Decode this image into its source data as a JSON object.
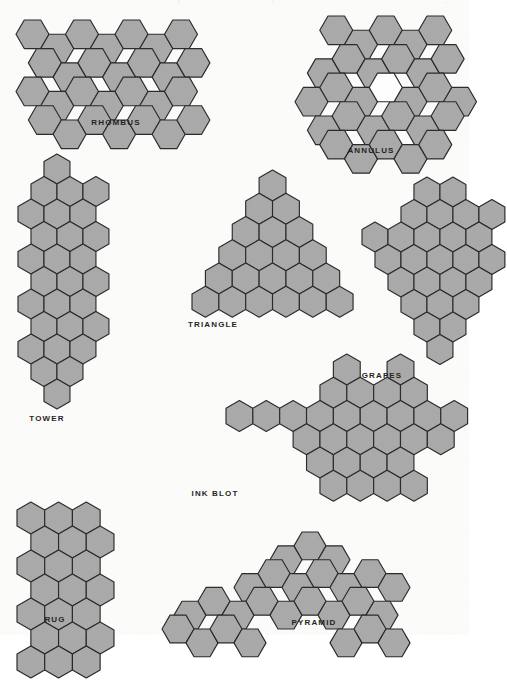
{
  "plate": {
    "width": 469,
    "height": 635,
    "background_color": "#fdfdfc",
    "hex_fill_color": "#a9a9a9",
    "hex_stroke_color": "#272727",
    "hole_fill_color": "#ffffff",
    "caption_color": "#1c1c1c",
    "header_fragment_left": "r",
    "header_fragment_mid": "f",
    "header_fragment_right": "..."
  },
  "shapes": [
    {
      "id": "rhombus",
      "label": "RHOMBUS",
      "orientation": "flat-top",
      "hex_count": 28,
      "description": "Four rows of seven flat-top hexagons, each row offset right to form a rhombus.",
      "size": 16.5,
      "origin_x": 14,
      "origin_y": 18,
      "caption_x": 116,
      "caption_y": 118,
      "cells": [
        [
          0,
          0
        ],
        [
          1,
          0
        ],
        [
          2,
          0
        ],
        [
          3,
          0
        ],
        [
          4,
          0
        ],
        [
          5,
          0
        ],
        [
          6,
          0
        ],
        [
          0,
          1
        ],
        [
          1,
          1
        ],
        [
          2,
          1
        ],
        [
          3,
          1
        ],
        [
          4,
          1
        ],
        [
          5,
          1
        ],
        [
          6,
          1
        ],
        [
          0,
          2
        ],
        [
          1,
          2
        ],
        [
          2,
          2
        ],
        [
          3,
          2
        ],
        [
          4,
          2
        ],
        [
          5,
          2
        ],
        [
          6,
          2
        ],
        [
          0,
          3
        ],
        [
          1,
          3
        ],
        [
          2,
          3
        ],
        [
          3,
          3
        ],
        [
          4,
          3
        ],
        [
          5,
          3
        ],
        [
          6,
          3
        ]
      ]
    },
    {
      "id": "annulus",
      "label": "ANNULUS",
      "orientation": "flat-top",
      "hex_count": 28,
      "description": "Hexagonal ring of radius two plus an outer band, with a single empty hexagon at the centre.",
      "size": 16.5,
      "origin_x": 293,
      "origin_y": 14,
      "caption_x": 371,
      "caption_y": 146,
      "cells": [
        [
          0,
          0
        ],
        [
          1,
          0
        ],
        [
          2,
          0
        ],
        [
          3,
          0
        ],
        [
          4,
          0
        ],
        [
          -1,
          1
        ],
        [
          0,
          1
        ],
        [
          1,
          1
        ],
        [
          2,
          1
        ],
        [
          3,
          1
        ],
        [
          4,
          1
        ],
        [
          -1,
          2
        ],
        [
          0,
          2
        ],
        [
          1,
          2
        ],
        [
          3,
          2
        ],
        [
          4,
          2
        ],
        [
          5,
          2
        ],
        [
          -1,
          3
        ],
        [
          0,
          3
        ],
        [
          1,
          3
        ],
        [
          2,
          3
        ],
        [
          3,
          3
        ],
        [
          4,
          3
        ],
        [
          0,
          4
        ],
        [
          1,
          4
        ],
        [
          2,
          4
        ],
        [
          3,
          4
        ],
        [
          4,
          4
        ]
      ],
      "holes": [
        [
          2,
          2
        ]
      ]
    },
    {
      "id": "tower",
      "label": "TOWER",
      "orientation": "pointy-top",
      "hex_count": 28,
      "description": "A tall narrow column of pointy-top hexagons, alternating rows of three and two.",
      "size": 15.0,
      "origin_x": 16,
      "origin_y": 152,
      "caption_x": 47,
      "caption_y": 414,
      "cells": [
        [
          1,
          0
        ],
        [
          0,
          1
        ],
        [
          1,
          1
        ],
        [
          2,
          1
        ],
        [
          0,
          2
        ],
        [
          1,
          2
        ],
        [
          2,
          2
        ],
        [
          0,
          3
        ],
        [
          1,
          3
        ],
        [
          2,
          3
        ],
        [
          0,
          4
        ],
        [
          1,
          4
        ],
        [
          2,
          4
        ],
        [
          0,
          5
        ],
        [
          1,
          5
        ],
        [
          2,
          5
        ],
        [
          0,
          6
        ],
        [
          1,
          6
        ],
        [
          2,
          6
        ],
        [
          0,
          7
        ],
        [
          1,
          7
        ],
        [
          2,
          7
        ],
        [
          0,
          8
        ],
        [
          1,
          8
        ],
        [
          2,
          8
        ],
        [
          0,
          9
        ],
        [
          1,
          9
        ],
        [
          1,
          10
        ]
      ]
    },
    {
      "id": "triangle",
      "label": "TRIANGLE",
      "orientation": "pointy-top",
      "hex_count": 21,
      "description": "Triangular stack of pointy-top hexagons in rows of one, two, three, four, five and six.",
      "size": 15.5,
      "origin_x": 190,
      "origin_y": 168,
      "caption_x": 213,
      "caption_y": 320,
      "cells": [
        [
          0,
          0
        ],
        [
          -1,
          1
        ],
        [
          0,
          1
        ],
        [
          -1,
          2
        ],
        [
          0,
          2
        ],
        [
          1,
          2
        ],
        [
          -2,
          3
        ],
        [
          -1,
          3
        ],
        [
          0,
          3
        ],
        [
          1,
          3
        ],
        [
          -2,
          4
        ],
        [
          -1,
          4
        ],
        [
          0,
          4
        ],
        [
          1,
          4
        ],
        [
          2,
          4
        ],
        [
          -3,
          5
        ],
        [
          -2,
          5
        ],
        [
          -1,
          5
        ],
        [
          0,
          5
        ],
        [
          1,
          5
        ],
        [
          2,
          5
        ]
      ]
    },
    {
      "id": "grapes",
      "label": "GRAPES",
      "orientation": "pointy-top",
      "hex_count": 26,
      "description": "A bunch-of-grapes cluster, broad at the top and tapering to a single hexagon at the bottom.",
      "size": 15.0,
      "origin_x": 360,
      "origin_y": 175,
      "caption_x": 382,
      "caption_y": 371,
      "cells": [
        [
          0,
          0
        ],
        [
          1,
          0
        ],
        [
          -1,
          1
        ],
        [
          0,
          1
        ],
        [
          1,
          1
        ],
        [
          2,
          1
        ],
        [
          -2,
          2
        ],
        [
          -1,
          2
        ],
        [
          0,
          2
        ],
        [
          1,
          2
        ],
        [
          2,
          2
        ],
        [
          -2,
          3
        ],
        [
          -1,
          3
        ],
        [
          0,
          3
        ],
        [
          1,
          3
        ],
        [
          2,
          3
        ],
        [
          -1,
          4
        ],
        [
          0,
          4
        ],
        [
          1,
          4
        ],
        [
          2,
          4
        ],
        [
          -1,
          5
        ],
        [
          0,
          5
        ],
        [
          1,
          5
        ],
        [
          0,
          6
        ],
        [
          1,
          6
        ],
        [
          0,
          7
        ]
      ]
    },
    {
      "id": "ink-blot",
      "label": "INK  BLOT",
      "orientation": "pointy-top",
      "hex_count": 30,
      "description": "Symmetric blot with two horns on top, side arms reaching left and right, and a flat foot.",
      "size": 15.5,
      "origin_x": 224,
      "origin_y": 352,
      "caption_x": 215,
      "caption_y": 489,
      "cells": [
        [
          0,
          0
        ],
        [
          2,
          0
        ],
        [
          -1,
          1
        ],
        [
          0,
          1
        ],
        [
          1,
          1
        ],
        [
          2,
          1
        ],
        [
          -4,
          2
        ],
        [
          -3,
          2
        ],
        [
          -2,
          2
        ],
        [
          -1,
          2
        ],
        [
          0,
          2
        ],
        [
          1,
          2
        ],
        [
          2,
          2
        ],
        [
          3,
          2
        ],
        [
          4,
          2
        ],
        [
          -2,
          3
        ],
        [
          -1,
          3
        ],
        [
          0,
          3
        ],
        [
          1,
          3
        ],
        [
          2,
          3
        ],
        [
          3,
          3
        ],
        [
          -1,
          4
        ],
        [
          0,
          4
        ],
        [
          1,
          4
        ],
        [
          2,
          4
        ],
        [
          -1,
          5
        ],
        [
          0,
          5
        ],
        [
          1,
          5
        ],
        [
          2,
          5
        ]
      ]
    },
    {
      "id": "rug",
      "label": "RUG",
      "orientation": "pointy-top",
      "hex_count": 23,
      "description": "Rectangular rug of pointy-top hexagons, five rows alternating three and two wide.",
      "size": 16.0,
      "origin_x": 15,
      "origin_y": 500,
      "caption_x": 55,
      "caption_y": 615,
      "cells": [
        [
          0,
          0
        ],
        [
          1,
          0
        ],
        [
          2,
          0
        ],
        [
          0,
          1
        ],
        [
          1,
          1
        ],
        [
          2,
          1
        ],
        [
          0,
          2
        ],
        [
          1,
          2
        ],
        [
          2,
          2
        ],
        [
          0,
          3
        ],
        [
          1,
          3
        ],
        [
          2,
          3
        ],
        [
          0,
          4
        ],
        [
          1,
          4
        ],
        [
          2,
          4
        ],
        [
          0,
          5
        ],
        [
          1,
          5
        ],
        [
          2,
          5
        ],
        [
          0,
          6
        ],
        [
          1,
          6
        ],
        [
          2,
          6
        ]
      ]
    },
    {
      "id": "pyramid",
      "label": "PYRAMID",
      "orientation": "flat-top",
      "hex_count": 26,
      "description": "Stepped pyramid of flat-top hexagons, widening from the apex down to a long base row.",
      "size": 16.0,
      "origin_x": 160,
      "origin_y": 530,
      "caption_x": 314,
      "caption_y": 618,
      "cells": [
        [
          5,
          0
        ],
        [
          6,
          0
        ],
        [
          7,
          0
        ],
        [
          3,
          1
        ],
        [
          4,
          1
        ],
        [
          5,
          1
        ],
        [
          6,
          1
        ],
        [
          7,
          1
        ],
        [
          8,
          1
        ],
        [
          9,
          1
        ],
        [
          1,
          2
        ],
        [
          2,
          2
        ],
        [
          3,
          2
        ],
        [
          4,
          2
        ],
        [
          5,
          2
        ],
        [
          6,
          2
        ],
        [
          7,
          2
        ],
        [
          8,
          2
        ],
        [
          9,
          2
        ],
        [
          0,
          3
        ],
        [
          1,
          3
        ],
        [
          2,
          3
        ],
        [
          3,
          3
        ],
        [
          7,
          3
        ],
        [
          8,
          3
        ],
        [
          9,
          3
        ]
      ]
    }
  ]
}
